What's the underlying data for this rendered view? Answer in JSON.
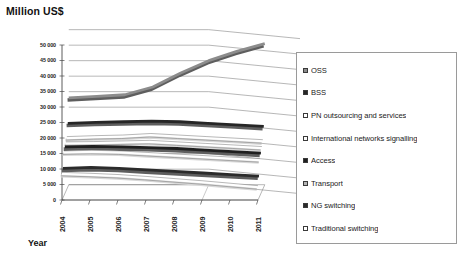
{
  "chart_data": {
    "type": "line",
    "title": "Million US$",
    "xlabel": "Year",
    "ylabel": "Million US$",
    "subtitle": "",
    "projection": "3d",
    "grid": true,
    "legend_position": "right",
    "ylim": [
      0,
      50000
    ],
    "categories": [
      "2004",
      "2005",
      "2006",
      "2007",
      "2008",
      "2009",
      "2010",
      "2011"
    ],
    "yticks": [
      "0",
      "5 000",
      "10 000",
      "15 000",
      "20 000",
      "25 000",
      "30 000",
      "35 000",
      "40 000",
      "45 000",
      "50 000"
    ],
    "ytick_values": [
      0,
      5000,
      10000,
      15000,
      20000,
      25000,
      30000,
      35000,
      40000,
      45000,
      50000
    ],
    "series": [
      {
        "name": "OSS",
        "swatch": "#8c8c8c",
        "values": [
          28000,
          28500,
          29000,
          31500,
          36000,
          40000,
          43000,
          45500
        ]
      },
      {
        "name": "BSS",
        "swatch": "#262626",
        "values": [
          20500,
          20800,
          21000,
          21200,
          21000,
          20500,
          20000,
          19500
        ]
      },
      {
        "name": "PN outsourcing and services",
        "swatch": "#ffffff",
        "values": [
          16500,
          16800,
          17000,
          17500,
          17000,
          16500,
          16000,
          15500
        ]
      },
      {
        "name": "International networks signalling",
        "swatch": "#fafafa",
        "values": [
          15500,
          15600,
          15800,
          16000,
          15500,
          15000,
          14500,
          14000
        ]
      },
      {
        "name": "Access",
        "swatch": "#1f1f1f",
        "values": [
          15000,
          15200,
          15000,
          14800,
          14500,
          14000,
          13500,
          13000
        ]
      },
      {
        "name": "Transport",
        "swatch": "#b5b5b5",
        "values": [
          14000,
          14200,
          14000,
          13500,
          13000,
          12500,
          12000,
          11500
        ]
      },
      {
        "name": "NG switching",
        "swatch": "#2b2b2b",
        "values": [
          9500,
          9800,
          9500,
          9000,
          8500,
          8000,
          7500,
          7000
        ]
      },
      {
        "name": "Traditional switching",
        "swatch": "#ffffff",
        "values": [
          8500,
          8200,
          7800,
          7200,
          6500,
          5800,
          5000,
          4200
        ]
      }
    ]
  },
  "legend": {
    "items": [
      {
        "label": "OSS"
      },
      {
        "label": "BSS"
      },
      {
        "label": "PN outsourcing and services"
      },
      {
        "label": "International networks signalling"
      },
      {
        "label": "Access"
      },
      {
        "label": "Transport"
      },
      {
        "label": "NG switching"
      },
      {
        "label": "Traditional switching"
      }
    ]
  },
  "colors": {
    "grid": "#7a7a7a",
    "axis": "#4a4a4a",
    "text": "#1a1a1a",
    "legend_border": "#9a9a9a",
    "background": "#ffffff"
  }
}
